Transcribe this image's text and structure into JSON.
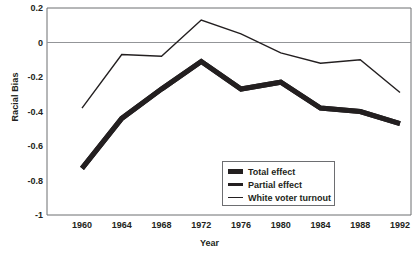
{
  "chart_data": {
    "type": "line",
    "title": "",
    "subtitle": "",
    "xlabel": "Year",
    "ylabel": "Racial Bias",
    "x": [
      1960,
      1964,
      1968,
      1972,
      1976,
      1980,
      1984,
      1988,
      1992
    ],
    "categories": [
      "1960",
      "1964",
      "1968",
      "1972",
      "1976",
      "1980",
      "1984",
      "1988",
      "1992"
    ],
    "xlim": [
      1958,
      1994
    ],
    "ylim": [
      -1,
      0.2
    ],
    "yticks": [
      "0.2",
      "0",
      "-0.2",
      "-0.4",
      "-0.6",
      "-0.8",
      "-1"
    ],
    "ytick_values": [
      0.2,
      0,
      -0.2,
      -0.4,
      -0.6,
      -0.8,
      -1
    ],
    "grid": "horizontal-zero-line-only",
    "legend_position": "inside-bottom-center",
    "series": [
      {
        "name": "Total effect",
        "style": "very-thick-solid",
        "color": "#231f20",
        "values": [
          -0.73,
          -0.44,
          -0.27,
          -0.11,
          -0.27,
          -0.23,
          -0.38,
          -0.4,
          -0.47
        ]
      },
      {
        "name": "Partial effect",
        "style": "thick-solid",
        "color": "#231f20",
        "values": [
          -0.73,
          -0.44,
          -0.27,
          -0.11,
          -0.27,
          -0.23,
          -0.38,
          -0.4,
          -0.47
        ]
      },
      {
        "name": "White voter turnout",
        "style": "thin-solid",
        "color": "#231f20",
        "values": [
          -0.38,
          -0.07,
          -0.08,
          0.13,
          0.05,
          -0.06,
          -0.12,
          -0.1,
          -0.29
        ]
      }
    ]
  },
  "legend": {
    "items": [
      {
        "label": "Total effect"
      },
      {
        "label": "Partial effect"
      },
      {
        "label": "White voter turnout"
      }
    ]
  },
  "colors": {
    "line": "#231f20",
    "axis": "#6d6e71",
    "zero_line": "#939598",
    "background": "#ffffff"
  }
}
